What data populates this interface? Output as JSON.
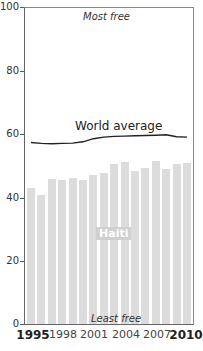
{
  "chart_data": {
    "type": "bar",
    "title": "",
    "xlabel": "",
    "ylabel": "",
    "ylim": [
      0,
      100
    ],
    "yticks": [
      0,
      20,
      40,
      60,
      80,
      100
    ],
    "x": [
      1995,
      1996,
      1997,
      1998,
      1999,
      2000,
      2001,
      2002,
      2003,
      2004,
      2005,
      2006,
      2007,
      2008,
      2009,
      2010
    ],
    "xtick_labels": [
      "1995",
      "1998",
      "2001",
      "2004",
      "2007",
      "2010"
    ],
    "series": [
      {
        "name": "Haiti",
        "type": "bar",
        "color": "#dcdcdc",
        "values": [
          42.8,
          40.7,
          45.6,
          45.4,
          45.8,
          45.4,
          46.9,
          47.6,
          50.2,
          50.8,
          48.2,
          49.0,
          51.2,
          48.7,
          50.3,
          50.5
        ]
      },
      {
        "name": "World average",
        "type": "line",
        "color": "#222222",
        "values": [
          57.4,
          57.1,
          57.0,
          57.1,
          57.2,
          57.6,
          58.6,
          59.1,
          59.3,
          59.4,
          59.5,
          59.6,
          59.7,
          59.8,
          59.2,
          59.1
        ]
      }
    ],
    "annotations": {
      "top": "Most free",
      "bottom": "Least free"
    },
    "grid": false,
    "legend": "inline labels"
  },
  "labels": {
    "most_free": "Most free",
    "least_free": "Least free",
    "world_average": "World average",
    "haiti": "Haiti",
    "y": [
      "100",
      "80",
      "60",
      "40",
      "20",
      "0"
    ],
    "x": [
      "1995",
      "1998",
      "2001",
      "2004",
      "2007",
      "2010"
    ]
  }
}
